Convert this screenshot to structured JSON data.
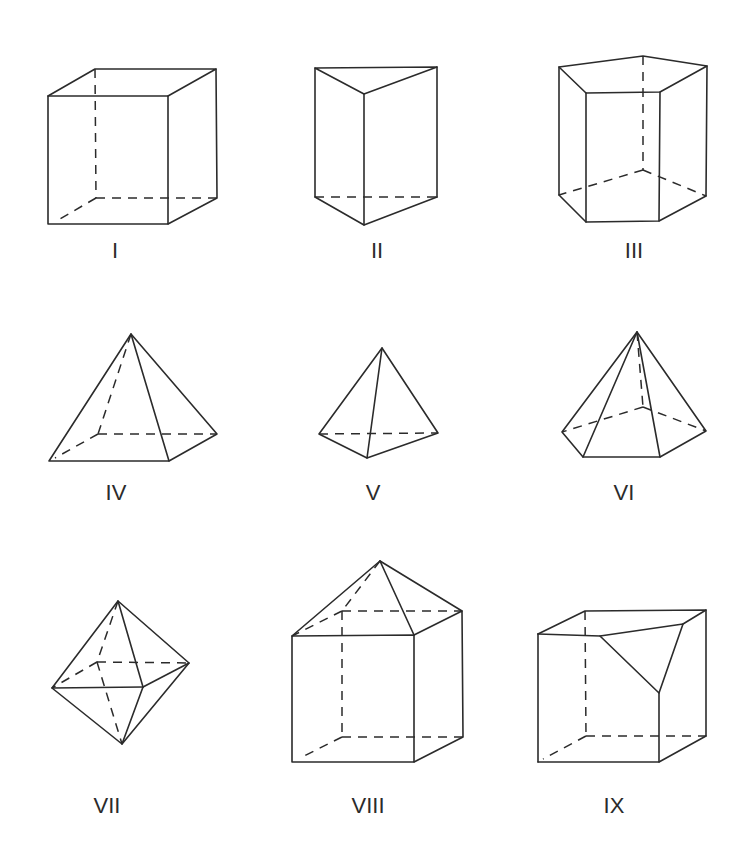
{
  "figure": {
    "stroke_color": "#2b2b2b",
    "background": "#ffffff"
  },
  "shapes": [
    {
      "id": "I",
      "label": "I",
      "name": "rectangular prism"
    },
    {
      "id": "II",
      "label": "II",
      "name": "triangular prism"
    },
    {
      "id": "III",
      "label": "III",
      "name": "pentagonal prism"
    },
    {
      "id": "IV",
      "label": "IV",
      "name": "square pyramid"
    },
    {
      "id": "V",
      "label": "V",
      "name": "triangular pyramid"
    },
    {
      "id": "VI",
      "label": "VI",
      "name": "pentagonal pyramid"
    },
    {
      "id": "VII",
      "label": "VII",
      "name": "octahedron"
    },
    {
      "id": "VIII",
      "label": "VIII",
      "name": "cube with pyramid on top"
    },
    {
      "id": "IX",
      "label": "IX",
      "name": "cube with corner truncated"
    }
  ]
}
